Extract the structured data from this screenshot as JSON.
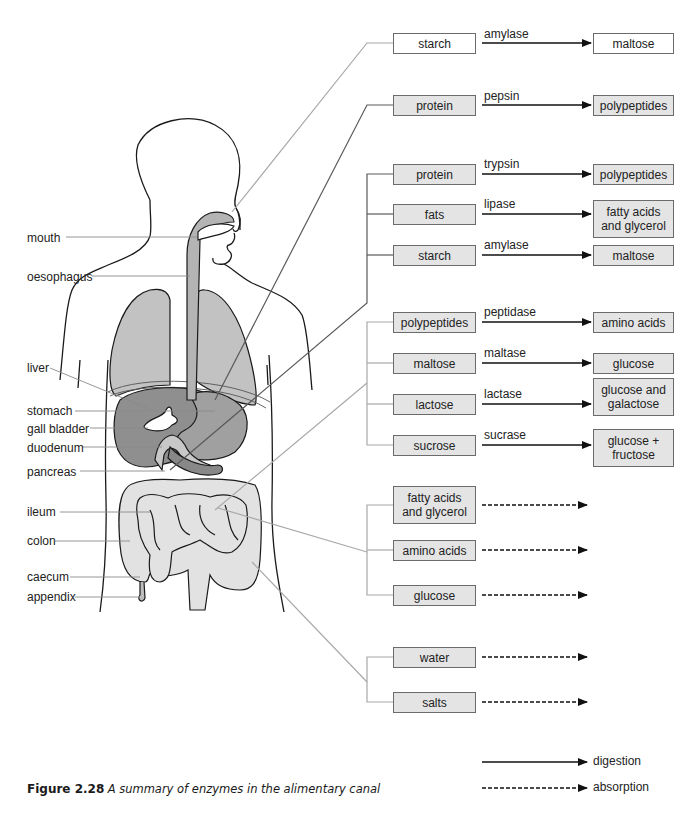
{
  "caption": {
    "figure_number": "Figure 2.28",
    "text": "A summary of enzymes in the alimentary canal"
  },
  "organ_labels": [
    {
      "id": "mouth",
      "label": "mouth",
      "x": 27,
      "y": 231
    },
    {
      "id": "oesophagus",
      "label": "oesophagus",
      "x": 27,
      "y": 270
    },
    {
      "id": "liver",
      "label": "liver",
      "x": 27,
      "y": 361
    },
    {
      "id": "stomach",
      "label": "stomach",
      "x": 27,
      "y": 404
    },
    {
      "id": "gall-bladder",
      "label": "gall bladder",
      "x": 27,
      "y": 422
    },
    {
      "id": "duodenum",
      "label": "duodenum",
      "x": 27,
      "y": 441
    },
    {
      "id": "pancreas",
      "label": "pancreas",
      "x": 27,
      "y": 465
    },
    {
      "id": "ileum",
      "label": "ileum",
      "x": 27,
      "y": 505
    },
    {
      "id": "colon",
      "label": "colon",
      "x": 27,
      "y": 534
    },
    {
      "id": "caecum",
      "label": "caecum",
      "x": 27,
      "y": 570
    },
    {
      "id": "appendix",
      "label": "appendix",
      "x": 27,
      "y": 590
    }
  ],
  "groups": [
    {
      "id": "mouth-group",
      "organ": "mouth",
      "rows": [
        {
          "substrate": "starch",
          "enzyme": "amylase",
          "product": "maltose",
          "y": 33,
          "fill": "white",
          "product_h": 20
        }
      ]
    },
    {
      "id": "stomach-group",
      "organ": "stomach",
      "rows": [
        {
          "substrate": "protein",
          "enzyme": "pepsin",
          "product": "polypeptides",
          "y": 95,
          "fill": "gray",
          "product_h": 20
        }
      ]
    },
    {
      "id": "pancreas-group",
      "organ": "pancreas",
      "rows": [
        {
          "substrate": "protein",
          "enzyme": "trypsin",
          "product": "polypeptides",
          "y": 164,
          "fill": "gray",
          "product_h": 20
        },
        {
          "substrate": "fats",
          "enzyme": "lipase",
          "product": "fatty acids and glycerol",
          "y": 204,
          "fill": "gray",
          "product_h": 38
        },
        {
          "substrate": "starch",
          "enzyme": "amylase",
          "product": "maltose",
          "y": 245,
          "fill": "gray",
          "product_h": 20
        }
      ]
    },
    {
      "id": "ileum-digestion-group",
      "organ": "ileum",
      "rows": [
        {
          "substrate": "polypeptides",
          "enzyme": "peptidase",
          "product": "amino acids",
          "y": 312,
          "fill": "gray",
          "product_h": 20
        },
        {
          "substrate": "maltose",
          "enzyme": "maltase",
          "product": "glucose",
          "y": 353,
          "fill": "gray",
          "product_h": 20
        },
        {
          "substrate": "lactose",
          "enzyme": "lactase",
          "product": "glucose and galactose",
          "y": 394,
          "fill": "gray",
          "product_h": 38
        },
        {
          "substrate": "sucrose",
          "enzyme": "sucrase",
          "product": "glucose + fructose",
          "y": 435,
          "fill": "gray",
          "product_h": 38
        }
      ]
    },
    {
      "id": "ileum-absorption-group",
      "organ": "ileum",
      "rows": [
        {
          "substrate": "fatty acids and glycerol",
          "y": 486,
          "fill": "gray",
          "h": 38
        },
        {
          "substrate": "amino acids",
          "y": 540,
          "fill": "gray",
          "h": 20
        },
        {
          "substrate": "glucose",
          "y": 585,
          "fill": "gray",
          "h": 20
        }
      ]
    },
    {
      "id": "colon-absorption-group",
      "organ": "colon",
      "rows": [
        {
          "substrate": "water",
          "y": 647,
          "fill": "gray",
          "h": 20
        },
        {
          "substrate": "salts",
          "y": 692,
          "fill": "gray",
          "h": 20
        }
      ]
    }
  ],
  "legend": {
    "digestion": "digestion",
    "absorption": "absorption"
  },
  "colors": {
    "box_gray": "#e4e4e4",
    "box_white": "#ffffff",
    "leader_light": "#a8a8a8",
    "leader_dark": "#5a5a5a",
    "organ_dark": "#8f8f8f",
    "organ_mid": "#b4b4b4",
    "organ_light": "#e2e2e2",
    "arrow": "#111111"
  }
}
